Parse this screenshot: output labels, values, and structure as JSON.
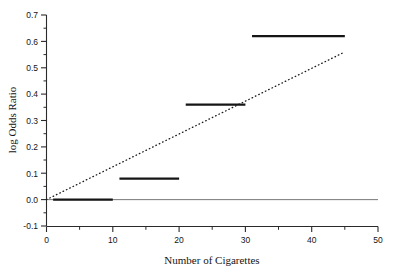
{
  "chart_data": {
    "type": "line",
    "title": "",
    "xlabel": "Number of Cigarettes",
    "ylabel": "log Odds Ratio",
    "xlim": [
      0,
      50
    ],
    "ylim": [
      -0.1,
      0.7
    ],
    "grid": false,
    "legend": "none",
    "xticks": [
      0,
      10,
      20,
      30,
      40,
      50
    ],
    "xtick_labels": [
      "0",
      "10",
      "20",
      "30",
      "40",
      "50"
    ],
    "x_minor_ticks": [
      5,
      15,
      25,
      35,
      45
    ],
    "yticks": [
      -0.1,
      0.0,
      0.1,
      0.2,
      0.3,
      0.4,
      0.5,
      0.6,
      0.7
    ],
    "ytick_labels": [
      "-0.1",
      "0.0",
      "0.1",
      "0.2",
      "0.3",
      "0.4",
      "0.5",
      "0.6",
      "0.7"
    ],
    "y_minor_ticks": [
      -0.05,
      0.05,
      0.15,
      0.25,
      0.35,
      0.45,
      0.55,
      0.65
    ],
    "series": [
      {
        "name": "Categorical step estimates",
        "type": "step-segments",
        "style": "solid",
        "color": "#151515",
        "linewidth": 2.2,
        "segments": [
          {
            "label": "1-10",
            "x_start": 1,
            "x_end": 10,
            "value": 0.0
          },
          {
            "label": "11-20",
            "x_start": 11,
            "x_end": 20,
            "value": 0.08
          },
          {
            "label": "21-30",
            "x_start": 21,
            "x_end": 30,
            "value": 0.36
          },
          {
            "label": "31-45",
            "x_start": 31,
            "x_end": 45,
            "value": 0.62
          }
        ]
      },
      {
        "name": "Linear dose-response fit",
        "type": "line",
        "style": "dotted",
        "color": "#1a1a1a",
        "linewidth": 1.3,
        "x": [
          0,
          45
        ],
        "y": [
          0.0,
          0.56
        ]
      },
      {
        "name": "Reference line at zero",
        "type": "line",
        "style": "solid",
        "color": "#777777",
        "linewidth": 1,
        "x": [
          0,
          50
        ],
        "y": [
          0.0,
          0.0
        ]
      }
    ]
  }
}
